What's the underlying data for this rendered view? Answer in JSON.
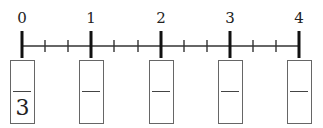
{
  "number_line": {
    "labels": [
      "0",
      "1",
      "2",
      "3",
      "4"
    ],
    "major_tick_x": [
      22,
      91,
      161,
      230,
      299
    ],
    "subdivisions_per_unit": 3,
    "line_color": "#222222"
  },
  "fraction_boxes": [
    {
      "numerator": "",
      "denominator": "3"
    },
    {
      "numerator": "",
      "denominator": ""
    },
    {
      "numerator": "",
      "denominator": ""
    },
    {
      "numerator": "",
      "denominator": ""
    },
    {
      "numerator": "",
      "denominator": ""
    }
  ]
}
